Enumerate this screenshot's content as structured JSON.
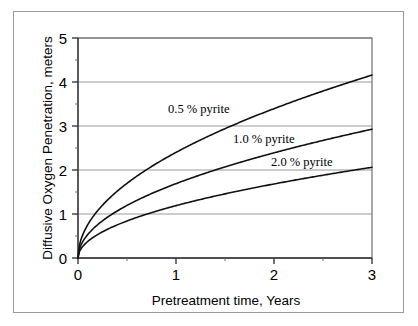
{
  "figure": {
    "background_color": "#ffffff",
    "frame_color": "#9a9a9a"
  },
  "chart_data": {
    "type": "line",
    "title": "",
    "xlabel": "Pretreatment time, Years",
    "ylabel": "Diffusive Oxygen Penetration, meters",
    "xlim": [
      0,
      3
    ],
    "ylim": [
      0,
      5
    ],
    "xticks": [
      0,
      1,
      2,
      3
    ],
    "xtick_labels": [
      "0",
      "1",
      "2",
      "3"
    ],
    "x_minor_ticks": [
      0.5,
      1.5,
      2.5
    ],
    "yticks": [
      0,
      1,
      2,
      3,
      4,
      5
    ],
    "ytick_labels": [
      "0",
      "1",
      "2",
      "3",
      "4",
      "5"
    ],
    "y_minor_ticks": [
      0.5,
      1.5,
      2.5,
      3.5,
      4.5
    ],
    "grid": "horizontal",
    "legend_position": "inline-annotations",
    "x": [
      0,
      0.05,
      0.1,
      0.2,
      0.3,
      0.4,
      0.5,
      0.6,
      0.7,
      0.8,
      0.9,
      1.0,
      1.2,
      1.4,
      1.6,
      1.8,
      2.0,
      2.2,
      2.4,
      2.6,
      2.8,
      3.0
    ],
    "series": [
      {
        "name": "0.5 % pyrite",
        "label": "0.5 % pyrite",
        "coefficient": 2.4,
        "color": "#111111",
        "values": [
          0,
          0.54,
          0.76,
          1.07,
          1.31,
          1.52,
          1.7,
          1.86,
          2.01,
          2.15,
          2.28,
          2.4,
          2.63,
          2.84,
          3.04,
          3.22,
          3.39,
          3.56,
          3.72,
          3.87,
          4.02,
          4.16
        ]
      },
      {
        "name": "1.0 % pyrite",
        "label": "1.0 % pyrite",
        "coefficient": 1.69,
        "color": "#111111",
        "values": [
          0,
          0.38,
          0.53,
          0.76,
          0.93,
          1.07,
          1.19,
          1.31,
          1.41,
          1.51,
          1.6,
          1.69,
          1.85,
          2.0,
          2.14,
          2.27,
          2.39,
          2.51,
          2.62,
          2.73,
          2.83,
          2.93
        ]
      },
      {
        "name": "2.0 % pyrite",
        "label": "2.0 % pyrite",
        "coefficient": 1.19,
        "color": "#111111",
        "values": [
          0,
          0.27,
          0.38,
          0.53,
          0.65,
          0.75,
          0.84,
          0.92,
          1.0,
          1.06,
          1.13,
          1.19,
          1.3,
          1.41,
          1.51,
          1.6,
          1.68,
          1.77,
          1.84,
          1.92,
          1.99,
          2.06
        ]
      }
    ],
    "annotations": [
      {
        "text": "0.5 % pyrite",
        "x_px": 168,
        "y_px": 113
      },
      {
        "text": "1.0 % pyrite",
        "x_px": 233,
        "y_px": 143
      },
      {
        "text": "2.0 % pyrite",
        "x_px": 271,
        "y_px": 166
      }
    ]
  }
}
